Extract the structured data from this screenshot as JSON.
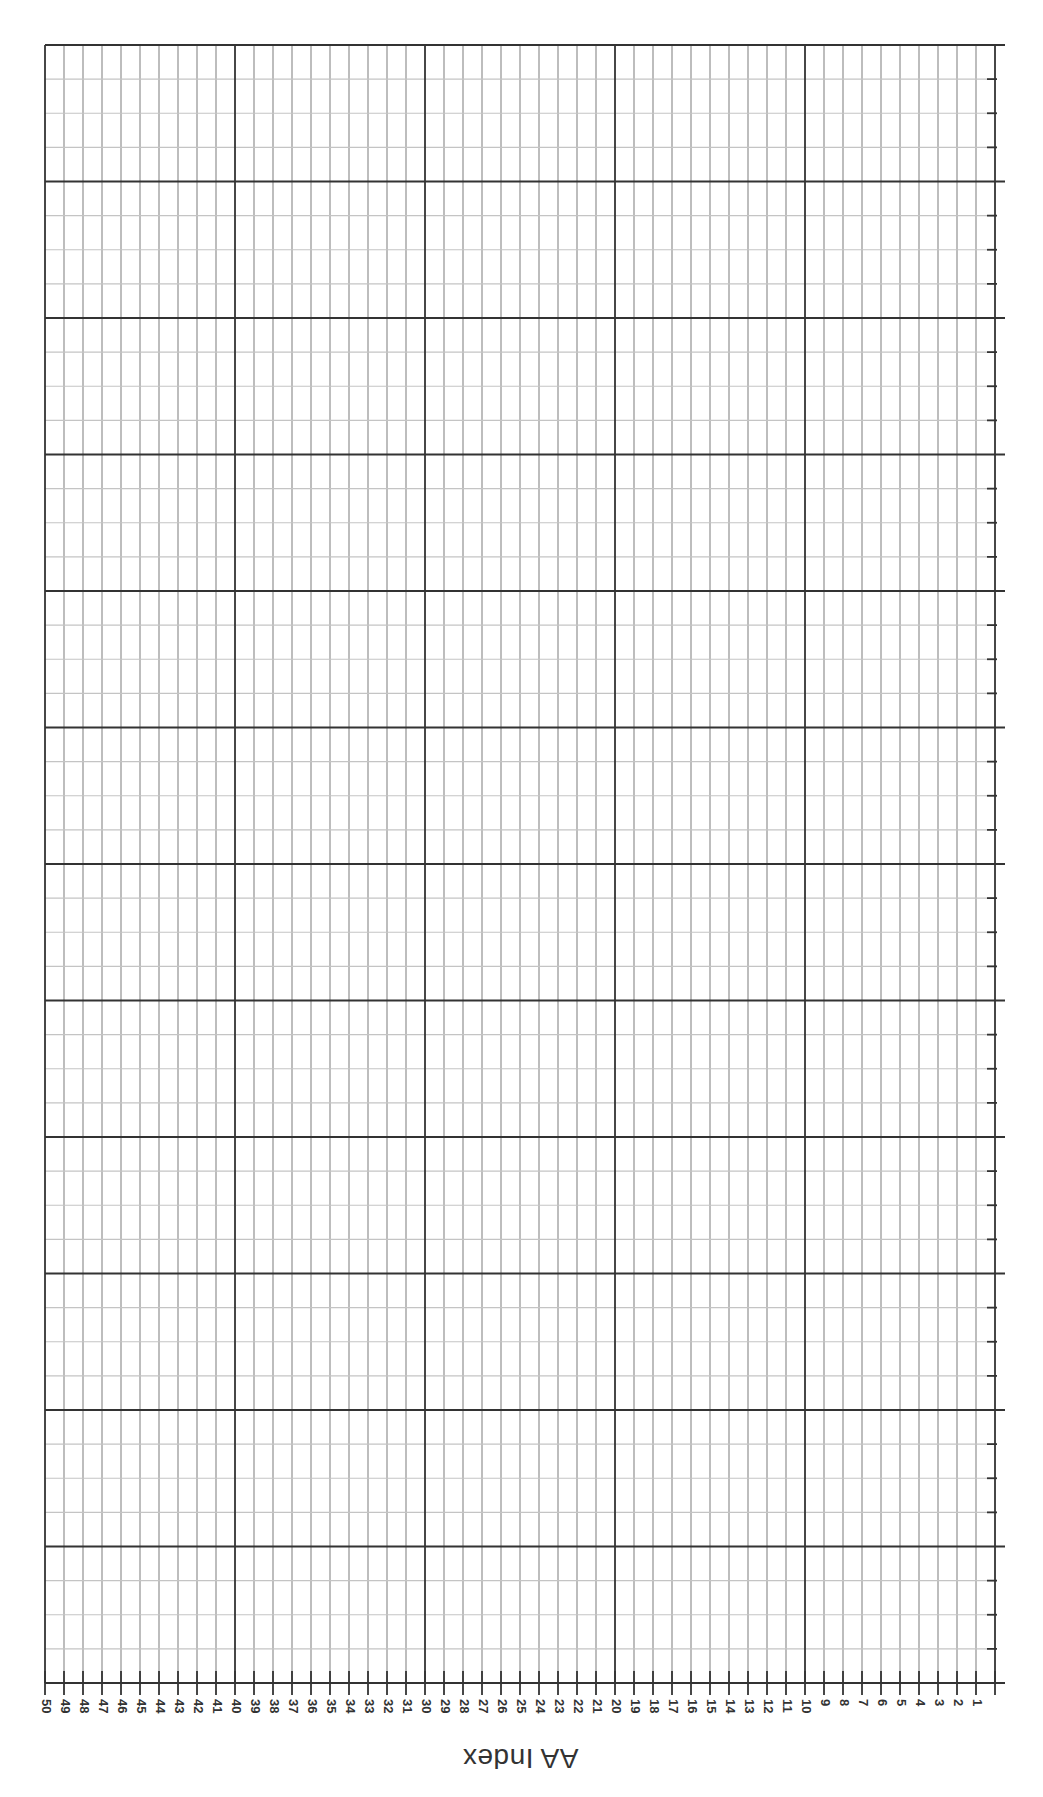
{
  "chart_data": {
    "type": "line",
    "title": "",
    "xlabel": "AA Index",
    "ylabel": "",
    "orientation": "rotated-180",
    "x_ticks": [
      50,
      49,
      48,
      47,
      46,
      45,
      44,
      43,
      42,
      41,
      40,
      39,
      38,
      37,
      36,
      35,
      34,
      33,
      32,
      31,
      30,
      29,
      28,
      27,
      26,
      25,
      24,
      23,
      22,
      21,
      20,
      19,
      18,
      17,
      16,
      15,
      14,
      13,
      12,
      11,
      10,
      9,
      8,
      7,
      6,
      5,
      4,
      3,
      2,
      1
    ],
    "xlim": [
      0,
      50
    ],
    "major_x_every": 10,
    "grid": true,
    "y_major_divisions": 12,
    "y_minor_per_major": 4,
    "series": [],
    "colors": {
      "major_line": "#333333",
      "minor_line": "#9a9a9a",
      "label": "#333333"
    }
  },
  "layout": {
    "plot_left": 45,
    "plot_right": 995,
    "plot_top": 45,
    "plot_bottom": 1683,
    "line_extend_right": 1005
  }
}
